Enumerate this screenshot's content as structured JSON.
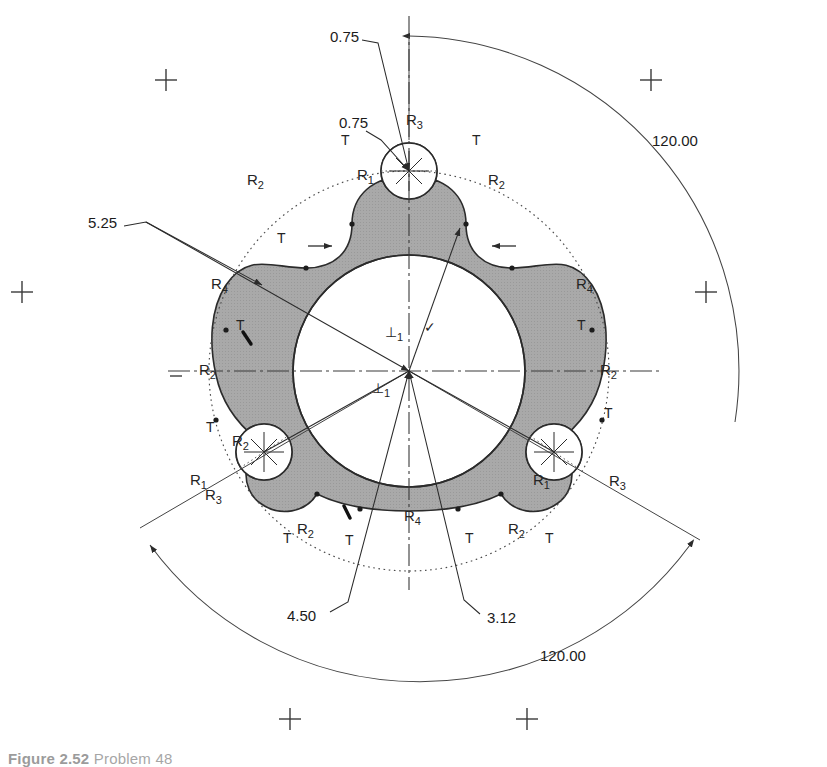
{
  "drawing": {
    "title": "Three-lobed epitrochoid cam plate — dimensioned engineering drawing",
    "background_color": "#ffffff",
    "hatch_fill_color": "#a8a8a8",
    "outline_color": "#2b2b2b",
    "centerline_color": "#3b3b3b",
    "construction_color": "#555555",
    "dimension_color": "#1b1b1b"
  },
  "dimensions": [
    {
      "id": "dim-bolt-hole-dia-top",
      "value": "0.75",
      "x": 330,
      "y": 42,
      "kind": "leader-diameter"
    },
    {
      "id": "dim-fillet-top-left",
      "value": "0.75",
      "x": 339,
      "y": 128,
      "kind": "leader-radius"
    },
    {
      "id": "dim-outer-dia",
      "value": "5.25",
      "x": 88,
      "y": 228,
      "kind": "leader-diameter"
    },
    {
      "id": "dim-bolt-circle",
      "value": "4.50",
      "x": 287,
      "y": 621,
      "kind": "leader-diameter"
    },
    {
      "id": "dim-bore-dia",
      "value": "3.12",
      "x": 487,
      "y": 623,
      "kind": "leader-diameter"
    },
    {
      "id": "dim-angle-upper-right",
      "value": "120.00",
      "x": 652,
      "y": 146,
      "kind": "angular"
    },
    {
      "id": "dim-angle-lower-right",
      "value": "120.00",
      "x": 540,
      "y": 661,
      "kind": "angular"
    }
  ],
  "radius_labels": [
    {
      "id": "r-top-lobe-outer",
      "base": "R",
      "sub": "3",
      "x": 406,
      "y": 125
    },
    {
      "id": "r-top-lobe-left",
      "base": "R",
      "sub": "1",
      "x": 357,
      "y": 180
    },
    {
      "id": "r-top-left-arc",
      "base": "R",
      "sub": "2",
      "x": 247,
      "y": 185
    },
    {
      "id": "r-top-right-arc",
      "base": "R",
      "sub": "2",
      "x": 488,
      "y": 185
    },
    {
      "id": "r-left-flank",
      "base": "R",
      "sub": "4",
      "x": 211,
      "y": 289
    },
    {
      "id": "r-right-flank",
      "base": "R",
      "sub": "4",
      "x": 576,
      "y": 289
    },
    {
      "id": "r-left-mid-arc",
      "base": "R",
      "sub": "2",
      "x": 199,
      "y": 375
    },
    {
      "id": "r-right-mid-arc",
      "base": "R",
      "sub": "2",
      "x": 600,
      "y": 375
    },
    {
      "id": "r-bl-lobe-inner",
      "base": "R",
      "sub": "2",
      "x": 232,
      "y": 446
    },
    {
      "id": "r-bl-lobe-left",
      "base": "R",
      "sub": "1",
      "x": 190,
      "y": 485
    },
    {
      "id": "r-bl-lobe-outer",
      "base": "R",
      "sub": "3",
      "x": 205,
      "y": 500
    },
    {
      "id": "r-br-lobe-left",
      "base": "R",
      "sub": "1",
      "x": 533,
      "y": 485
    },
    {
      "id": "r-br-lobe-outer",
      "base": "R",
      "sub": "3",
      "x": 609,
      "y": 486
    },
    {
      "id": "r-bottom-flank",
      "base": "R",
      "sub": "4",
      "x": 404,
      "y": 521
    },
    {
      "id": "r-bottom-left-arc",
      "base": "R",
      "sub": "2",
      "x": 297,
      "y": 534
    },
    {
      "id": "r-bottom-right-arc",
      "base": "R",
      "sub": "2",
      "x": 508,
      "y": 534
    }
  ],
  "tangency_labels": [
    {
      "id": "t-top-left",
      "label": "T",
      "x": 341,
      "y": 145
    },
    {
      "id": "t-top-right",
      "label": "T",
      "x": 472,
      "y": 145
    },
    {
      "id": "t-upper-left",
      "label": "T",
      "x": 277,
      "y": 243
    },
    {
      "id": "t-left-upper",
      "label": "T",
      "x": 236,
      "y": 330
    },
    {
      "id": "t-right-upper",
      "label": "T",
      "x": 577,
      "y": 330
    },
    {
      "id": "t-left-lower",
      "label": "T",
      "x": 206,
      "y": 432
    },
    {
      "id": "t-right-lower",
      "label": "T",
      "x": 604,
      "y": 418
    },
    {
      "id": "t-bottom-left",
      "label": "T",
      "x": 283,
      "y": 543
    },
    {
      "id": "t-bottom-leftmid",
      "label": "T",
      "x": 345,
      "y": 545
    },
    {
      "id": "t-bottom-rightmid",
      "label": "T",
      "x": 465,
      "y": 543
    },
    {
      "id": "t-bottom-right",
      "label": "T",
      "x": 545,
      "y": 543
    }
  ],
  "gdt_symbols": [
    {
      "id": "perpendicularity-upper",
      "glyph": "⊥",
      "sub": "1",
      "x": 385,
      "y": 337
    },
    {
      "id": "perpendicularity-lower",
      "glyph": "⊥",
      "sub": "1",
      "x": 372,
      "y": 393
    },
    {
      "id": "parallel-check-mark",
      "glyph": "✓",
      "sub": "",
      "x": 424,
      "y": 332
    }
  ],
  "crosshair_markers": [
    {
      "id": "cross-top-left",
      "x": 166,
      "y": 80
    },
    {
      "id": "cross-top-right",
      "x": 651,
      "y": 80
    },
    {
      "id": "cross-mid-left",
      "x": 22,
      "y": 292
    },
    {
      "id": "cross-mid-right",
      "x": 706,
      "y": 292
    },
    {
      "id": "cross-bottom-left",
      "x": 290,
      "y": 719
    },
    {
      "id": "cross-bottom-right",
      "x": 527,
      "y": 719
    }
  ],
  "geometry": {
    "center": {
      "x": 409,
      "y": 371
    },
    "bore_radius": 116,
    "bolt_circle_radius": 167,
    "bolt_hole_radius": 28,
    "construction_circle_radius": 200,
    "outer_arc_radius": 196,
    "lobe_angles_deg": [
      -90,
      30,
      150
    ]
  },
  "caption": {
    "figure_label": "Figure 2.52",
    "text": "Problem 48"
  }
}
